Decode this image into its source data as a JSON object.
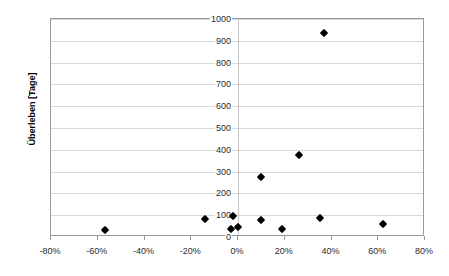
{
  "chart": {
    "y_axis_title": "Überleben [Tage]",
    "x_axis_title": ""
  },
  "chart_data": {
    "type": "scatter",
    "title": "",
    "xlabel": "",
    "ylabel": "Überleben [Tage]",
    "xlim": [
      -80,
      80
    ],
    "ylim": [
      0,
      1000
    ],
    "xticks": [
      -80,
      -60,
      -40,
      -20,
      0,
      20,
      40,
      60,
      80
    ],
    "xtick_labels": [
      "-80%",
      "-60%",
      "-40%",
      "-20%",
      "0%",
      "20%",
      "40%",
      "60%",
      "80%"
    ],
    "yticks": [
      0,
      100,
      200,
      300,
      400,
      500,
      600,
      700,
      800,
      900,
      1000
    ],
    "ytick_labels": [
      "0",
      "100",
      "200",
      "300",
      "400",
      "500",
      "600",
      "700",
      "800",
      "900",
      "1000"
    ],
    "x_unit": "percent",
    "grid": true,
    "grid_axis": "y",
    "legend": false,
    "marker": "diamond",
    "marker_color": "#000000",
    "series": [
      {
        "name": "",
        "points": [
          {
            "x": -57,
            "y": 30
          },
          {
            "x": -14,
            "y": 82
          },
          {
            "x": -3,
            "y": 35
          },
          {
            "x": -2,
            "y": 95
          },
          {
            "x": 0,
            "y": 45
          },
          {
            "x": 10,
            "y": 78
          },
          {
            "x": 10,
            "y": 275
          },
          {
            "x": 19,
            "y": 35
          },
          {
            "x": 26,
            "y": 375
          },
          {
            "x": 35,
            "y": 85
          },
          {
            "x": 37,
            "y": 935
          },
          {
            "x": 62,
            "y": 60
          }
        ]
      }
    ]
  }
}
